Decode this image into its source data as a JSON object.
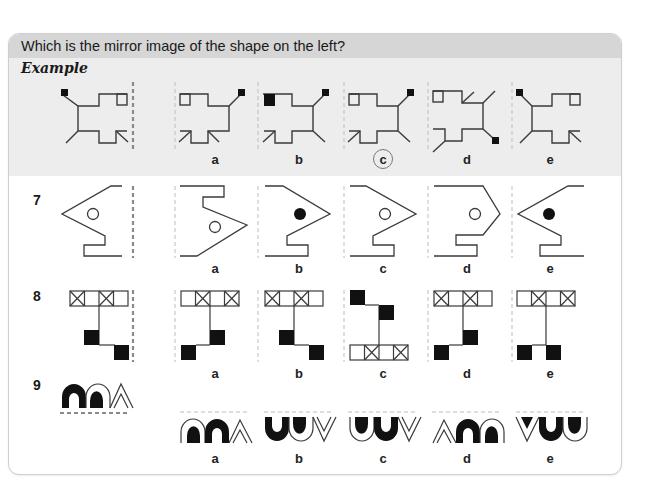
{
  "header": {
    "title": "Which is the mirror image of the shape on the left?",
    "watermark": "Mirror Images"
  },
  "example": {
    "label": "Example",
    "options": [
      "a",
      "b",
      "c",
      "d",
      "e"
    ],
    "answer": "c"
  },
  "questions": [
    {
      "number": "7",
      "options": [
        "a",
        "b",
        "c",
        "d",
        "e"
      ],
      "mirror_axis": "vertical-right"
    },
    {
      "number": "8",
      "options": [
        "a",
        "b",
        "c",
        "d",
        "e"
      ],
      "mirror_axis": "vertical-right"
    },
    {
      "number": "9",
      "options": [
        "a",
        "b",
        "c",
        "d",
        "e"
      ],
      "mirror_axis": "horizontal-below"
    }
  ],
  "colors": {
    "header_bg": "#d6d6d6",
    "example_bg": "#ededed",
    "line": "#3a3a3a",
    "fill": "#111111",
    "dash": "#bdbdbd",
    "mirror_dash": "#8a8a8a"
  }
}
